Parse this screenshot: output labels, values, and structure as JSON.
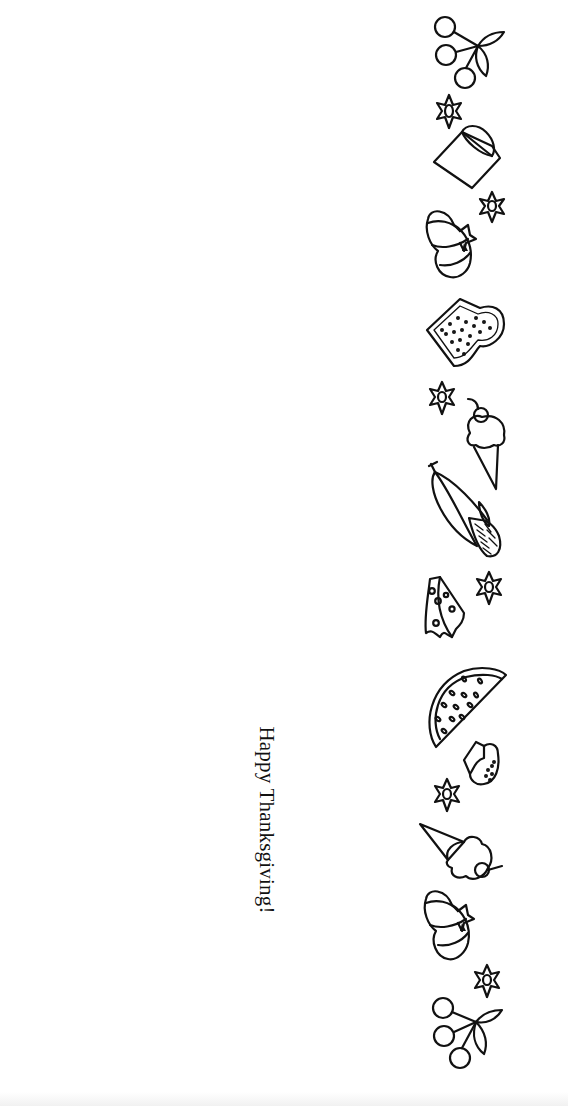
{
  "card": {
    "greeting": "Happy Thanksgiving!",
    "text_color": "#111111",
    "background": "#ffffff"
  },
  "border_icons": [
    {
      "name": "cherries-icon",
      "y": 15
    },
    {
      "name": "flower-icon",
      "y": 95
    },
    {
      "name": "glass-icon",
      "y": 120
    },
    {
      "name": "flower-icon",
      "y": 190
    },
    {
      "name": "pumpkin-icon",
      "y": 205
    },
    {
      "name": "toast-icon",
      "y": 295
    },
    {
      "name": "flower-icon",
      "y": 380
    },
    {
      "name": "ice-cream-cone-icon",
      "y": 395
    },
    {
      "name": "corn-icon",
      "y": 460
    },
    {
      "name": "cheese-icon",
      "y": 578
    },
    {
      "name": "flower-icon",
      "y": 570
    },
    {
      "name": "watermelon-slice-icon",
      "y": 665
    },
    {
      "name": "biscuit-icon",
      "y": 740
    },
    {
      "name": "flower-icon",
      "y": 777
    },
    {
      "name": "ice-cream-cone-icon",
      "y": 820
    },
    {
      "name": "pumpkin-icon",
      "y": 885
    },
    {
      "name": "flower-icon",
      "y": 963
    },
    {
      "name": "cherries-icon",
      "y": 995
    }
  ]
}
